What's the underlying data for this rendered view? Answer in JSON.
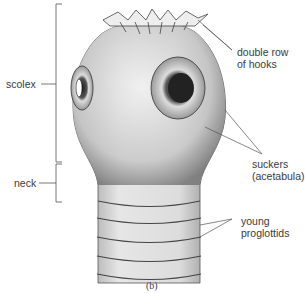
{
  "diagram": {
    "caption": "(b)",
    "labels": {
      "scolex": "scolex",
      "neck": "neck",
      "hooks_line1": "double row",
      "hooks_line2": "of hooks",
      "suckers_line1": "suckers",
      "suckers_line2": "(acetabula)",
      "proglottids_line1": "young",
      "proglottids_line2": "proglottids"
    }
  }
}
